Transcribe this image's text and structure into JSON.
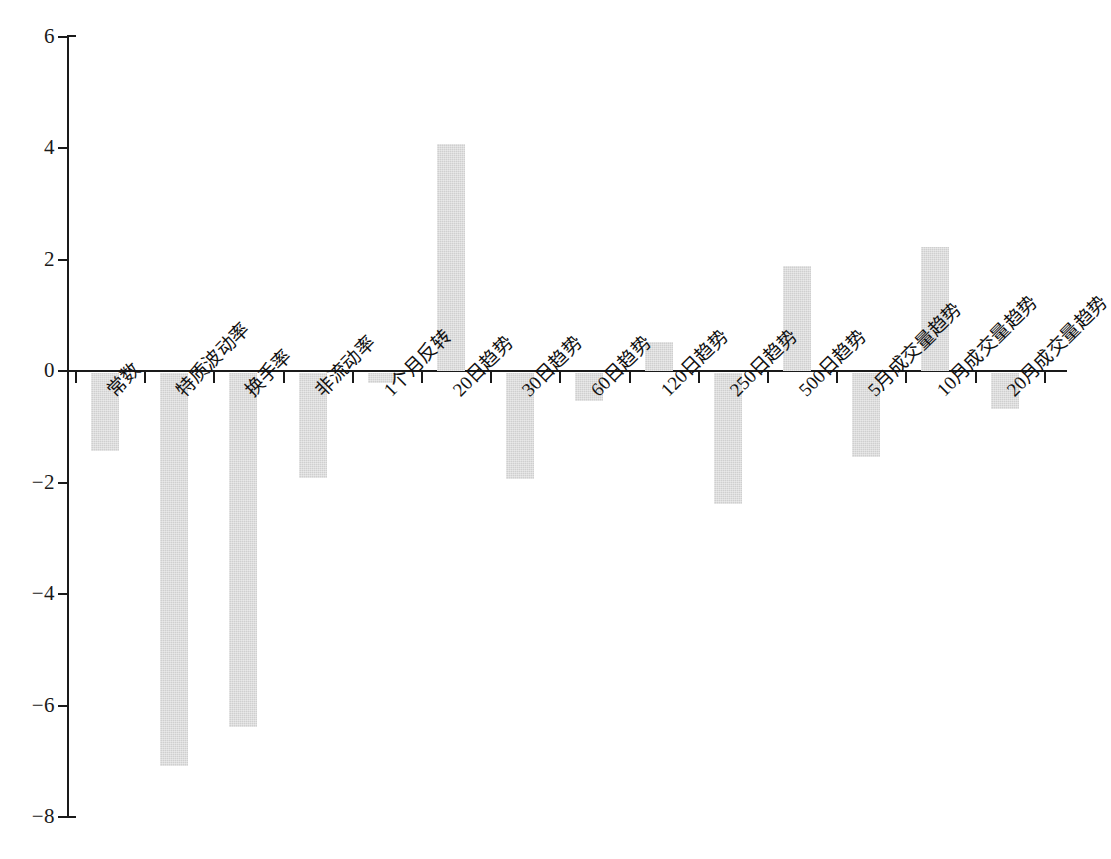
{
  "chart_data": {
    "type": "bar",
    "title": "",
    "subtitle": "",
    "xlabel": "",
    "ylabel": "",
    "ylim": [
      -8,
      6
    ],
    "yticks": [
      6,
      4,
      2,
      0,
      -2,
      -4,
      -6,
      -8
    ],
    "ytick_labels": [
      "6",
      "4",
      "2",
      "0",
      "−2",
      "−4",
      "−6",
      "−8"
    ],
    "grid": false,
    "legend": null,
    "bar_color": "#cfcfcf",
    "axis_color": "#1a1a1a",
    "categories": [
      "常数",
      "特质波动率",
      "换手率",
      "非流动率",
      "1个月反转",
      "20日趋势",
      "30日趋势",
      "60日趋势",
      "120日趋势",
      "250日趋势",
      "500日趋势",
      "5月成交量趋势",
      "10月成交量趋势",
      "20月成交量趋势"
    ],
    "values": [
      -1.4,
      -7.05,
      -6.35,
      -1.88,
      -0.18,
      4.07,
      -1.9,
      -0.5,
      0.52,
      -2.35,
      1.88,
      -1.5,
      2.22,
      -0.65
    ]
  }
}
